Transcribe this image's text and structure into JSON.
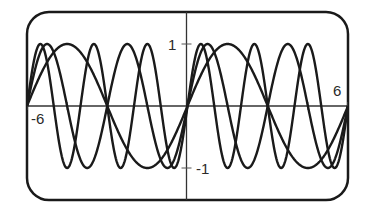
{
  "chart_data": {
    "type": "line",
    "title": "",
    "xlabel": "",
    "ylabel": "",
    "xlim": [
      -6.283,
      6.283
    ],
    "ylim": [
      -1.25,
      1.25
    ],
    "grid": false,
    "legend": null,
    "x_tick_spacing": 1.5708,
    "y_ticks": [
      -1,
      1
    ],
    "tick_labels": {
      "x_left": "-6",
      "x_right": "6",
      "y_top": "1",
      "y_bottom": "-1"
    },
    "series": [
      {
        "name": "y = sin(x)",
        "frequency": 1
      },
      {
        "name": "y = sin(2x)",
        "frequency": 2
      },
      {
        "name": "y = sin(3x)",
        "frequency": 3
      }
    ],
    "stroke_color": "#1a1a1a",
    "frame": "rounded-rectangle"
  }
}
